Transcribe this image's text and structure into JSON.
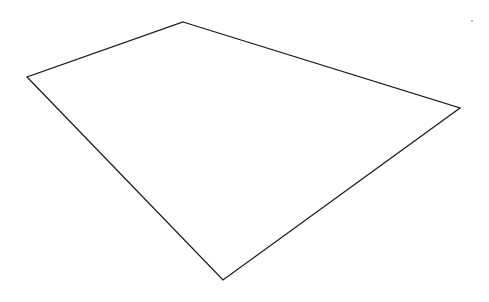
{
  "canvas": {
    "width": 489,
    "height": 302,
    "background": "#ffffff"
  },
  "shape": {
    "type": "quadrilateral",
    "stroke": "#1a1a1a",
    "stroke_width": 1.3,
    "fill": "none",
    "points": "183,22 460,108 223,280 27,77"
  },
  "speck": {
    "x": 472,
    "y": 21,
    "r": 0.9,
    "fill": "#9a9a9a"
  }
}
